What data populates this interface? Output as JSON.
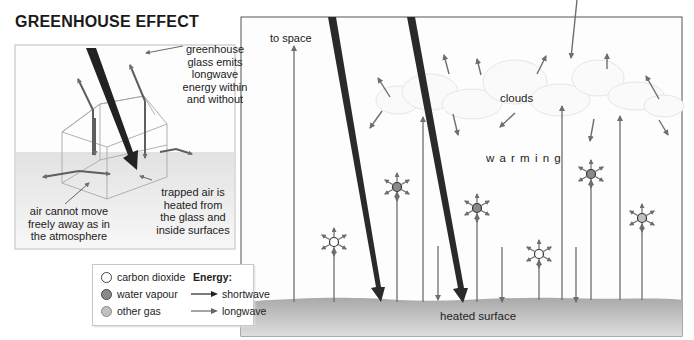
{
  "title": "GREENHOUSE EFFECT",
  "inset": {
    "glass_label": [
      "greenhouse",
      "glass emits",
      "longwave",
      "energy within",
      "and without"
    ],
    "trapped_label": [
      "trapped air is",
      "heated from",
      "the glass and",
      "inside surfaces"
    ],
    "air_label": [
      "air cannot move",
      "freely away as in",
      "the atmosphere"
    ]
  },
  "main": {
    "to_space": "to space",
    "clouds": "clouds",
    "warming": "w a r m i n g",
    "surface": "heated surface"
  },
  "legend": {
    "gases": [
      {
        "label": "carbon dioxide",
        "color": "#ffffff"
      },
      {
        "label": "water vapour",
        "color": "#8a8a8a"
      },
      {
        "label": "other gas",
        "color": "#c0c0c0"
      }
    ],
    "energy_title": "Energy:",
    "energy": [
      {
        "label": "shortwave",
        "color": "#222222"
      },
      {
        "label": "longwave",
        "color": "#666666"
      }
    ]
  },
  "colors": {
    "shortwave": "#2a2a2a",
    "longwave": "#6e6e6e",
    "surface": "#bdbdbd"
  }
}
